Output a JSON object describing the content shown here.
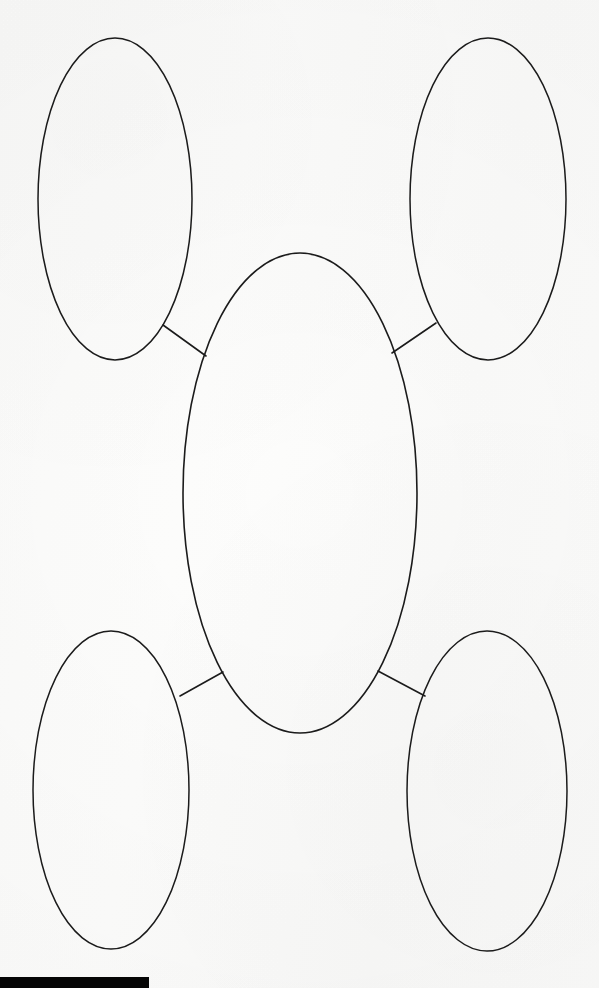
{
  "document": {
    "title": "Blank concept map worksheet",
    "page_background": "#fcfcfc",
    "ink_color": "#1b1b1b",
    "width": 599,
    "height": 988
  },
  "diagram": {
    "type": "concept-map",
    "layout": "central-node-with-four-satellites",
    "node_count": 5,
    "connector_count": 4,
    "nodes": [
      {
        "id": "center",
        "role": "central-topic",
        "label": "",
        "cx": 300,
        "cy": 493,
        "rx": 117,
        "ry": 240
      },
      {
        "id": "top-left",
        "role": "supporting-detail",
        "label": "",
        "cx": 115,
        "cy": 199,
        "rx": 77,
        "ry": 161
      },
      {
        "id": "top-right",
        "role": "supporting-detail",
        "label": "",
        "cx": 488,
        "cy": 199,
        "rx": 78,
        "ry": 161
      },
      {
        "id": "bottom-left",
        "role": "supporting-detail",
        "label": "",
        "cx": 111,
        "cy": 790,
        "rx": 78,
        "ry": 159
      },
      {
        "id": "bottom-right",
        "role": "supporting-detail",
        "label": "",
        "cx": 487,
        "cy": 791,
        "rx": 80,
        "ry": 160
      }
    ],
    "connectors": [
      {
        "id": "center-to-top-left",
        "from": "top-left",
        "to": "center",
        "x1": 163,
        "y1": 325,
        "x2": 206,
        "y2": 356
      },
      {
        "id": "center-to-top-right",
        "from": "top-right",
        "to": "center",
        "x1": 436,
        "y1": 323,
        "x2": 392,
        "y2": 353
      },
      {
        "id": "center-to-bottom-left",
        "from": "bottom-left",
        "to": "center",
        "x1": 180,
        "y1": 696,
        "x2": 223,
        "y2": 672
      },
      {
        "id": "center-to-bottom-right",
        "from": "bottom-right",
        "to": "center",
        "x1": 378,
        "y1": 671,
        "x2": 425,
        "y2": 696
      }
    ]
  },
  "scan_artifact": {
    "name": "black-scan-bar",
    "color": "#050505",
    "x": 0,
    "y": 977,
    "width": 149,
    "height": 11
  }
}
